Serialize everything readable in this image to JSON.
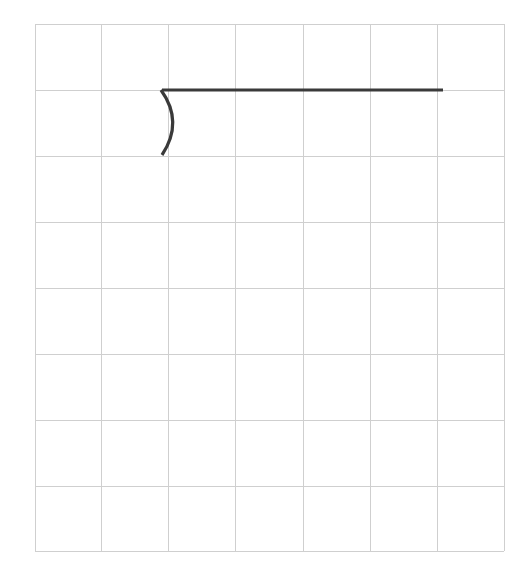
{
  "canvas": {
    "width": 528,
    "height": 568,
    "background": "#ffffff"
  },
  "grid": {
    "x_lines": [
      35,
      101,
      168,
      235,
      303,
      370,
      437,
      504
    ],
    "y_lines": [
      24,
      90,
      156,
      222,
      288,
      354,
      420,
      486,
      551
    ],
    "columns": 7,
    "rows": 8,
    "color": "#cfcfcf",
    "stroke_width": 1
  },
  "drawing": {
    "stroke_color": "#3a3a3a",
    "stroke_width": 3.2,
    "segments": [
      {
        "type": "line",
        "name": "horizontal-line",
        "from": [
          162,
          90
        ],
        "to": [
          443,
          90
        ]
      },
      {
        "type": "curve",
        "name": "arc-curve",
        "from": [
          161,
          90
        ],
        "control": [
          184,
          122
        ],
        "to": [
          162,
          155
        ]
      }
    ]
  }
}
